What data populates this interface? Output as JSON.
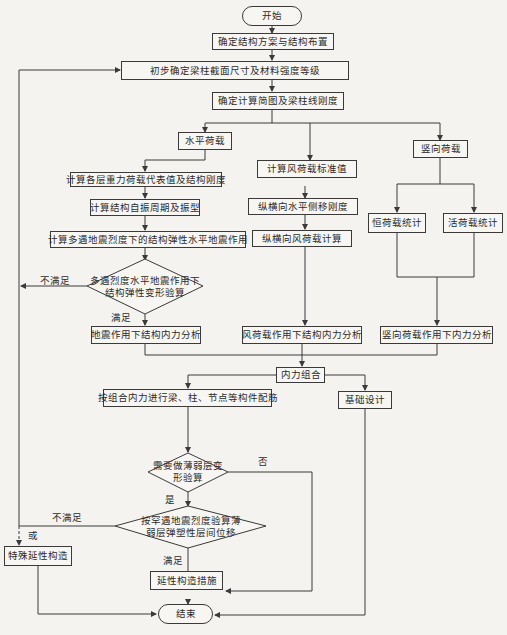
{
  "flowchart": {
    "start": "开始",
    "end": "结束",
    "steps": {
      "layout": "确定结构方案与结构布置",
      "preliminary": "初步确定梁柱截面尺寸及材料强度等级",
      "diagram": "确定计算简图及梁柱线刚度",
      "horizontal": "水平荷载",
      "vertical": "竖向荷载",
      "gravity": "计算各层重力荷载代表值及结构刚度",
      "period": "计算结构自振周期及振型",
      "seismic": "计算多遇地震烈度下的结构弹性水平地震作用",
      "wind_std": "计算风荷载标准值",
      "lateral_stiff": "纵横向水平侧移刚度",
      "wind_calc": "纵横向风荷载计算",
      "dead": "恒荷载统计",
      "live": "活荷载统计",
      "seismic_force": "地震作用下结构内力分析",
      "wind_force": "风荷载作用下结构内力分析",
      "vertical_force": "竖向荷载作用下内力分析",
      "combine": "内力组合",
      "reinforce": "按组合内力进行梁、柱、节点等构件配筋",
      "foundation": "基础设计",
      "special_ductile": "特殊延性构造",
      "ductile": "延性构造措施"
    },
    "decisions": {
      "elastic_check": "多遇烈度水平地震作用下\n结构弹性变形验算",
      "weak_layer_need": "需要做薄弱层变\n形验算",
      "rare_check": "按罕遇地震烈度验算薄\n弱层弹塑性层间位移"
    },
    "edge_labels": {
      "not_satisfied_1": "不满足",
      "satisfied_1": "满足",
      "no": "否",
      "yes": "是",
      "not_satisfied_2": "不满足",
      "or": "或",
      "satisfied_2": "满足"
    },
    "colors": {
      "line": "#3a3a3a",
      "background": "#f4f3ef"
    }
  }
}
